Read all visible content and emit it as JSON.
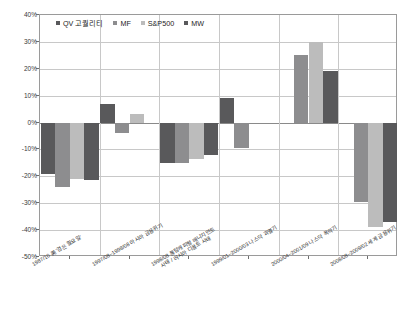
{
  "chart_data": {
    "type": "bar",
    "title": "",
    "xlabel": "",
    "ylabel": "",
    "ylim": [
      -50,
      40
    ],
    "ytick_step": 10,
    "grid": true,
    "legend_position": "top-left",
    "ytick_labels": [
      "40%",
      "30%",
      "20%",
      "10%",
      "0%",
      "-10%",
      "-20%",
      "-30%",
      "-40%",
      "-50%"
    ],
    "ytick_values": [
      40,
      30,
      20,
      10,
      0,
      -10,
      -20,
      -30,
      -40,
      -50
    ],
    "categories": [
      "1987/10 美 '검은 월요일'",
      "1997/08~1998/08 아시아 금융위기",
      "1998/08 롱텀캐피털 매니지먼트\n사태 / 러시아 디폴트 사태",
      "1999/01~2000/03 나스닥 과열기",
      "2000/04~2001/09 나스닥 폭락기",
      "2008/08~2009/02 세계 금융위기"
    ],
    "categories_display": [
      {
        "line1": "1987/10 美 '검은 월요일'",
        "line2": ""
      },
      {
        "line1": "1997/08~1998/08 아시아 금융위기",
        "line2": ""
      },
      {
        "line1": "1998/08 롱텀캐피털 매니지먼트",
        "line2": "사태 / 러시아 디폴트 사태"
      },
      {
        "line1": "1999/01~2000/03 나스닥 과열기",
        "line2": ""
      },
      {
        "line1": "2000/04~2001/09 나스닥 폭락기",
        "line2": ""
      },
      {
        "line1": "2008/08~2009/02 세계 금융위기",
        "line2": ""
      }
    ],
    "series": [
      {
        "name": "QV 고퀄리티",
        "color": "#59595b",
        "values": [
          -19.0,
          7.0,
          -15.0,
          9.0,
          0.0,
          0.0
        ]
      },
      {
        "name": "MF",
        "color": "#8d8d8f",
        "values": [
          -24.0,
          -4.0,
          -15.0,
          -9.5,
          25.0,
          -29.5
        ]
      },
      {
        "name": "S&P500",
        "color": "#bcbcbc",
        "values": [
          -21.0,
          3.0,
          -13.5,
          0.0,
          30.0,
          -39.0
        ]
      },
      {
        "name": "MW",
        "color": "#59595b",
        "values": [
          -21.5,
          0.0,
          -12.0,
          0.0,
          19.0,
          -37.0
        ]
      }
    ],
    "group_extra": [
      {
        "note": ""
      },
      {
        "note": ""
      },
      {
        "note": ""
      },
      {
        "note": ""
      },
      {
        "note": ""
      },
      {
        "note": ""
      }
    ]
  },
  "legend": {
    "items": [
      {
        "label": "QV 고퀄리티",
        "color": "#59595b"
      },
      {
        "label": "MF",
        "color": "#8d8d8f"
      },
      {
        "label": "S&P500",
        "color": "#bcbcbc"
      },
      {
        "label": "MW",
        "color": "#59595b"
      }
    ]
  },
  "axis": {
    "y_max_label": "40%",
    "y_min_label": "-50%",
    "zero_label": "0%"
  }
}
